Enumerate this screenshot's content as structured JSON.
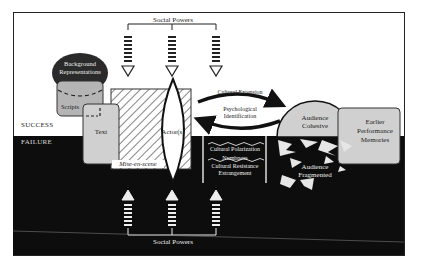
{
  "diagram": {
    "zones": {
      "success": "SUCCESS",
      "failure": "FAILURE"
    },
    "social_powers_top": "Social Powers",
    "social_powers_bottom": "Social Powers",
    "background_representations": "Background Representations",
    "background_line1": "Background",
    "background_line2": "Representations",
    "scripts": "Scripts",
    "text": "Text",
    "mise_en_scene": "Mise-en-scene",
    "actors": "Actor(s)",
    "cultural_extension": "Cultural Extension",
    "psych_line1": "Psychological",
    "psych_line2": "Identification",
    "cultural_polarization": "Cultural Polarization",
    "numbness": "Numbness",
    "cultural_resistance": "Cultural Resistance",
    "estrangement": "Estrangement",
    "audience_cohesive_line1": "Audience",
    "audience_cohesive_line2": "Cohesive",
    "audience_fragmented_line1": "Audience",
    "audience_fragmented_line2": "Fragmented",
    "earlier_line1": "Earlier",
    "earlier_line2": "Performance",
    "earlier_line3": "Memories",
    "colors": {
      "background": "#ffffff",
      "failure": "#0d0d0d",
      "box_fill": "#cfcfcf",
      "dark_cap": "#2a2a2a",
      "line": "#111111"
    }
  }
}
